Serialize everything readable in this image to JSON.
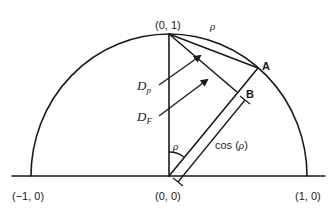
{
  "diagram": {
    "type": "geometric-construction",
    "colors": {
      "stroke": "#1a1a1a",
      "background": "#ffffff"
    },
    "labels": {
      "top": "(0, 1)",
      "origin": "(0, 0)",
      "left": "(−1, 0)",
      "right": "(1, 0)",
      "arc_rho": "ρ",
      "angle_rho": "ρ",
      "point_a": "A",
      "point_b": "B",
      "dp_main": "D",
      "dp_sub": "p",
      "df_main": "D",
      "df_sub": "F",
      "cos": "cos (",
      "cos_arg": "ρ",
      "cos_close": ")"
    },
    "elements": [
      "semicircle radius 1",
      "horizontal axis",
      "vertical segment (0,0)-(0,1)",
      "segment (0,0)-A at angle rho from vertical",
      "segment (0,1)-A (chord)",
      "segment (0,1)-B perpendicular to OA",
      "arrow D_p",
      "arrow D_F",
      "dimension line cos(rho) parallel to OB",
      "angle arc rho at origin"
    ]
  }
}
